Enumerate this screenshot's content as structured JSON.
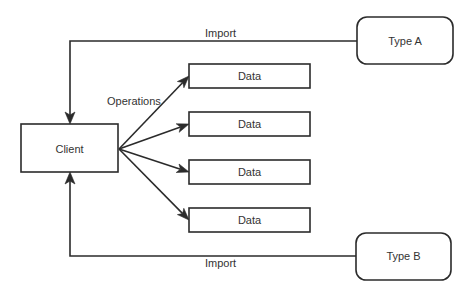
{
  "diagram": {
    "type": "flow",
    "nodes": {
      "client": {
        "label": "Client",
        "shape": "rectangle"
      },
      "data": [
        {
          "label": "Data",
          "shape": "rectangle"
        },
        {
          "label": "Data",
          "shape": "rectangle"
        },
        {
          "label": "Data",
          "shape": "rectangle"
        },
        {
          "label": "Data",
          "shape": "rectangle"
        }
      ],
      "type_a": {
        "label": "Type A",
        "shape": "rounded-rectangle"
      },
      "type_b": {
        "label": "Type B",
        "shape": "rounded-rectangle"
      }
    },
    "edges": {
      "import_top": {
        "label": "Import",
        "from": "Type A",
        "to": "Client"
      },
      "import_bottom": {
        "label": "Import",
        "from": "Type B",
        "to": "Client"
      },
      "operations": {
        "label": "Operations",
        "from": "Client",
        "to": "Data (x4)"
      }
    },
    "colors": {
      "stroke": "#2b2b2b",
      "text": "#333333",
      "background": "#ffffff"
    }
  }
}
